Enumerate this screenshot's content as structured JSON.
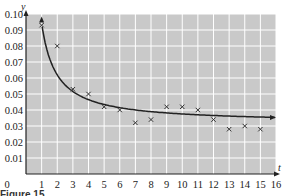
{
  "chart_data": {
    "type": "scatter",
    "title": "",
    "xlabel": "t",
    "ylabel": "y",
    "xlim": [
      0,
      16
    ],
    "ylim": [
      0,
      0.1
    ],
    "grid": true,
    "x_ticks": [
      "0",
      "1",
      "2",
      "3",
      "4",
      "5",
      "6",
      "7",
      "8",
      "9",
      "10",
      "11",
      "12",
      "13",
      "14",
      "15",
      "16"
    ],
    "y_ticks": [
      "0.01",
      "0.02",
      "0.03",
      "0.04",
      "0.05",
      "0.06",
      "0.07",
      "0.08",
      "0.09",
      "0.10"
    ],
    "series": [
      {
        "name": "data points",
        "marker": "x",
        "x": [
          1,
          2,
          3,
          4,
          5,
          6,
          7,
          8,
          9,
          10,
          11,
          12,
          13,
          14,
          15
        ],
        "y": [
          0.093,
          0.08,
          0.053,
          0.05,
          0.042,
          0.04,
          0.032,
          0.034,
          0.042,
          0.042,
          0.04,
          0.034,
          0.028,
          0.03,
          0.028
        ]
      },
      {
        "name": "fitted curve",
        "type": "line",
        "description": "decreasing curve approaching ~0.033, arrowheads at both ends",
        "x": [
          1,
          1.5,
          2,
          3,
          4,
          5,
          6,
          8,
          10,
          12,
          14,
          16
        ],
        "y": [
          0.1,
          0.079,
          0.068,
          0.055,
          0.048,
          0.044,
          0.041,
          0.038,
          0.036,
          0.035,
          0.034,
          0.0335
        ]
      }
    ],
    "colors": {
      "background": "#c8c8c8",
      "grid": "#ffffff",
      "curve": "#222222",
      "marker": "#333333"
    }
  },
  "caption": {
    "text": "Figure 15"
  }
}
